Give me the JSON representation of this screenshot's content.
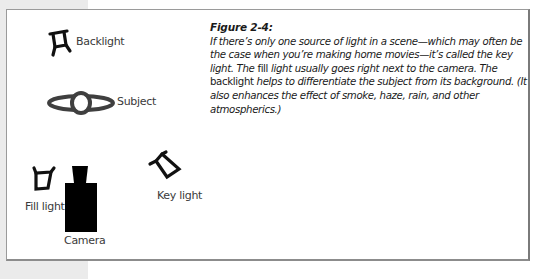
{
  "figure": {
    "title": "Figure 2-4:",
    "caption_segments": [
      "If there’s only one source of light in a scene—which may often be the case when you’re making home movies—it’s called the key light. The ",
      "fill",
      " light usually goes right next to the camera. The ",
      "backlight",
      " helps to differentiate the subject from its background. (It also enhances the effect of smoke, haze, rain, and other atmospherics.)"
    ]
  },
  "diagram": {
    "labels": {
      "backlight": "Backlight",
      "subject": "Subject",
      "fill_light": "Fill light",
      "camera": "Camera",
      "key_light": "Key light"
    },
    "colors": {
      "light_fixture": "#111111",
      "subject": "#3f3f3f",
      "camera": "#000000",
      "frame_border": "#8a8a8a",
      "margin_strip": "#ebebeb"
    }
  }
}
